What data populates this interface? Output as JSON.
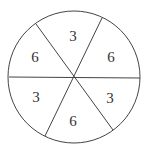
{
  "diagram": {
    "type": "spinner",
    "sections": 6,
    "stroke_color": "#444444",
    "labels": [
      {
        "position": "top",
        "value": "3"
      },
      {
        "position": "upper-right",
        "value": "6"
      },
      {
        "position": "lower-right",
        "value": "3"
      },
      {
        "position": "bottom",
        "value": "6"
      },
      {
        "position": "lower-left",
        "value": "3"
      },
      {
        "position": "upper-left",
        "value": "6"
      }
    ]
  }
}
